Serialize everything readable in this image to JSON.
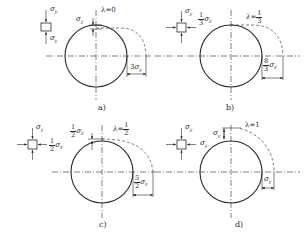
{
  "figure": {
    "panels": [
      {
        "id": "a",
        "caption": "a)",
        "lambda_label": "λ=0",
        "lambda_value": "0",
        "stress_element": {
          "vertical": "σy",
          "horizontal": null
        },
        "top_offset_label": "σy",
        "right_offset_label": "3σy",
        "right_coef": "3"
      },
      {
        "id": "b",
        "caption": "b)",
        "lambda_label": "λ=1/3",
        "lambda_num": "1",
        "lambda_den": "3",
        "stress_element": {
          "vertical": "σy",
          "horizontal_num": "1",
          "horizontal_den": "3",
          "horizontal_sym": "σy"
        },
        "top_offset_label": null,
        "right_offset_num": "8",
        "right_offset_den": "3",
        "right_offset_sym": "σy"
      },
      {
        "id": "c",
        "caption": "c)",
        "lambda_label": "λ=1/2",
        "lambda_num": "1",
        "lambda_den": "2",
        "stress_element": {
          "vertical": "σy",
          "horizontal_num": "1",
          "horizontal_den": "2",
          "horizontal_sym": "σy"
        },
        "top_offset_num": "1",
        "top_offset_den": "2",
        "top_offset_sym": "σy",
        "right_offset_num": "5",
        "right_offset_den": "2",
        "right_offset_sym": "σy"
      },
      {
        "id": "d",
        "caption": "d)",
        "lambda_label": "λ=1",
        "lambda_value": "1",
        "stress_element": {
          "vertical": "σy",
          "horizontal": "σy"
        },
        "top_offset_label": "σy",
        "right_offset_label": "σy"
      }
    ],
    "symbols": {
      "sigma": "σ",
      "sub_y": "y",
      "lambda": "λ",
      "eq": "="
    },
    "colors": {
      "line": "#2a2a2a",
      "background": "#ffffff"
    }
  }
}
